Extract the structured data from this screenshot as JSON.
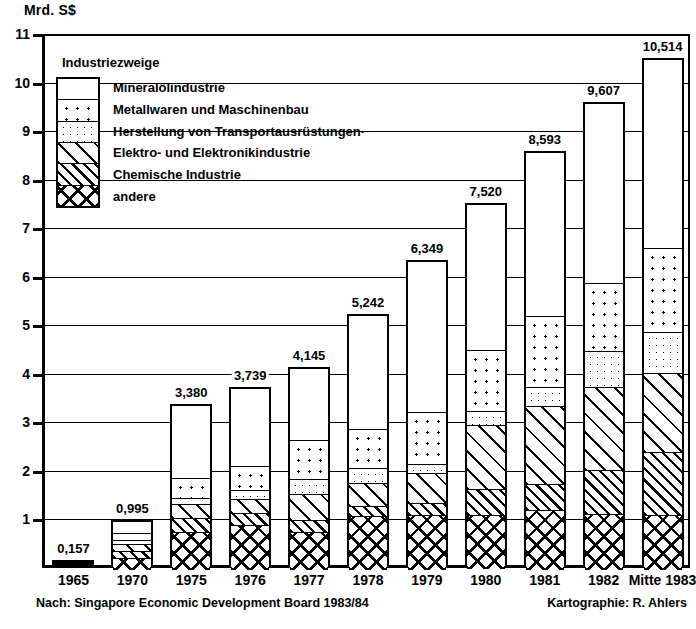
{
  "axis": {
    "y_title": "Mrd. S$",
    "y_ticks": [
      "11",
      "10",
      "9",
      "8",
      "7",
      "6",
      "5",
      "4",
      "3",
      "2",
      "1"
    ]
  },
  "legend": {
    "title": "Industriezweige",
    "items": [
      {
        "key": "mineral",
        "label": "Mineralölindustrie"
      },
      {
        "key": "metall",
        "label": "Metallwaren und Maschinenbau"
      },
      {
        "key": "transport",
        "label": "Herstellung von Transportausrüstungen·"
      },
      {
        "key": "elektro",
        "label": "Elektro- und Elektronikindustrie"
      },
      {
        "key": "chem",
        "label": "Chemische Industrie"
      },
      {
        "key": "andere",
        "label": "andere"
      }
    ]
  },
  "footnotes": {
    "source": "Nach: Singapore Economic Development Board 1983/84",
    "cartography": "Kartographie: R. Ahlers"
  },
  "chart_data": {
    "type": "bar",
    "title": "Mrd. S$",
    "xlabel": "",
    "ylabel": "Mrd. S$",
    "ylim": [
      0,
      11
    ],
    "grid": true,
    "stacked": true,
    "legend_position": "inside-top-left",
    "categories": [
      "1965",
      "1970",
      "1975",
      "1976",
      "1977",
      "1978",
      "1979",
      "1980",
      "1981",
      "1982",
      "Mitte 1983"
    ],
    "totals": [
      0.157,
      0.995,
      3.38,
      3.739,
      4.145,
      5.242,
      6.349,
      7.52,
      8.593,
      9.607,
      10.514
    ],
    "total_labels": [
      "0,157",
      "0,995",
      "3,380",
      "3,739",
      "4,145",
      "5,242",
      "6,349",
      "7,520",
      "8,593",
      "9,607",
      "10,514"
    ],
    "series": [
      {
        "name": "Mineralölindustrie",
        "key": "mineral",
        "values": [
          0.157,
          0.23,
          1.48,
          1.6,
          1.47,
          2.34,
          3.09,
          2.99,
          3.37,
          3.7,
          3.89
        ]
      },
      {
        "name": "Metallwaren und Maschinenbau",
        "key": "metall",
        "values": [
          0.0,
          0.14,
          0.41,
          0.5,
          0.8,
          0.8,
          1.08,
          1.26,
          1.45,
          1.4,
          1.73
        ]
      },
      {
        "name": "Herstellung von Transportausrüstungen",
        "key": "transport",
        "values": [
          0.0,
          0.09,
          0.13,
          0.17,
          0.31,
          0.3,
          0.18,
          0.29,
          0.4,
          0.74,
          0.84
        ]
      },
      {
        "name": "Elektro- und Elektronikindustrie",
        "key": "elektro",
        "values": [
          0.0,
          0.14,
          0.28,
          0.3,
          0.54,
          0.48,
          0.62,
          1.32,
          1.61,
          1.71,
          1.63
        ]
      },
      {
        "name": "Chemische Industrie",
        "key": "chem",
        "values": [
          0.0,
          0.15,
          0.3,
          0.25,
          0.25,
          0.21,
          0.25,
          0.52,
          0.52,
          0.91,
          1.3
        ]
      },
      {
        "name": "andere",
        "key": "andere",
        "values": [
          0.0,
          0.25,
          0.78,
          0.92,
          0.78,
          1.11,
          1.13,
          1.13,
          1.24,
          1.15,
          1.13
        ]
      }
    ]
  }
}
